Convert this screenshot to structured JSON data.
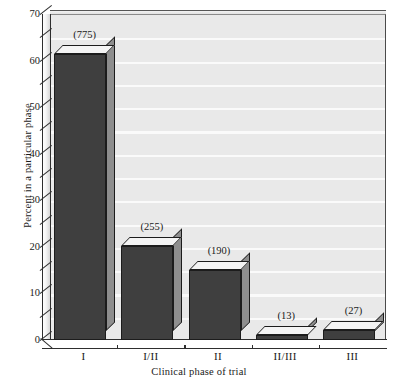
{
  "chart_data": {
    "type": "bar",
    "title": "",
    "subtitle": "",
    "xlabel": "Clinical phase of trial",
    "ylabel": "Percent in a particular phase",
    "categories": [
      "I",
      "I/II",
      "II",
      "II/III",
      "III"
    ],
    "values": [
      61.5,
      20.2,
      15.1,
      1.0,
      2.1
    ],
    "data_labels": [
      "(775)",
      "(255)",
      "(190)",
      "(13)",
      "(27)"
    ],
    "counts": [
      775,
      255,
      190,
      13,
      27
    ],
    "ylim": [
      0,
      70
    ],
    "ytick_labels": [
      "0",
      "10",
      "20",
      "30",
      "40",
      "50",
      "60",
      "70"
    ],
    "ytick_values": [
      0,
      10,
      20,
      30,
      40,
      50,
      60,
      70
    ],
    "yminor_step": 5,
    "grid": true,
    "grid_color": "#fafafa",
    "panel_color": "#e9e9e9",
    "bar_face_color": "#3f3f3f",
    "bar_top_color": "#f4f4f4",
    "bar_side_color": "#8e8e8e",
    "bar_edge_color": "#1c1c1c",
    "legend": null,
    "legend_position": "none",
    "three_d": true
  }
}
